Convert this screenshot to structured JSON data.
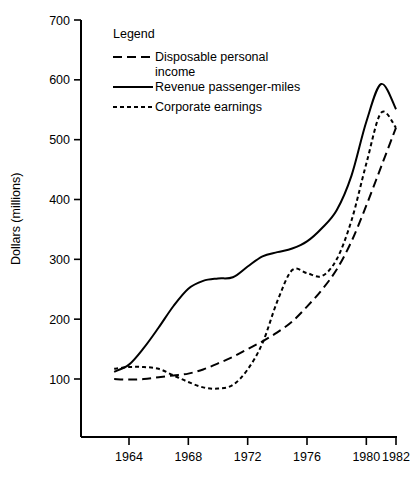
{
  "chart_data": {
    "type": "line",
    "title": "",
    "xlabel": "",
    "ylabel": "Dollars (millions)",
    "xlim": [
      1962.8,
      1982
    ],
    "ylim": [
      0,
      700
    ],
    "ytick_labels": [
      "100",
      "200",
      "300",
      "400",
      "500",
      "600",
      "700"
    ],
    "ytick_values": [
      100,
      200,
      300,
      400,
      500,
      600,
      700
    ],
    "xtick_labels": [
      "1964",
      "1968",
      "1972",
      "1976",
      "1980",
      "1982"
    ],
    "xtick_values": [
      1964,
      1968,
      1972,
      1976,
      1980,
      1982
    ],
    "grid": false,
    "legend_position": "upper-left-inside",
    "legend_title": "Legend",
    "series": [
      {
        "name": "Disposable personal income",
        "style": "long-dash",
        "x": [
          1963.0,
          1964.0,
          1965.0,
          1966.0,
          1967.0,
          1968.0,
          1969.0,
          1970.0,
          1971.0,
          1972.0,
          1973.0,
          1974.0,
          1975.0,
          1976.0,
          1977.0,
          1978.0,
          1979.0,
          1980.0,
          1981.0,
          1982.0
        ],
        "values": [
          100,
          99,
          100,
          103,
          106,
          109,
          116,
          126,
          137,
          150,
          163,
          178,
          196,
          221,
          249,
          283,
          330,
          390,
          455,
          520
        ]
      },
      {
        "name": "Revenue passenger-miles",
        "style": "solid",
        "x": [
          1963.0,
          1964.0,
          1965.0,
          1966.0,
          1967.0,
          1968.0,
          1969.0,
          1970.0,
          1971.0,
          1972.0,
          1973.0,
          1974.0,
          1975.0,
          1976.0,
          1977.0,
          1978.0,
          1979.0,
          1980.0,
          1981.0,
          1982.0
        ],
        "values": [
          112,
          124,
          152,
          186,
          222,
          251,
          264,
          268,
          270,
          288,
          305,
          312,
          318,
          330,
          352,
          382,
          440,
          530,
          593,
          551
        ]
      },
      {
        "name": "Corporate earnings",
        "style": "short-dash",
        "x": [
          1963.0,
          1964.0,
          1965.0,
          1966.0,
          1967.0,
          1968.0,
          1969.0,
          1970.0,
          1971.0,
          1972.0,
          1973.0,
          1974.0,
          1975.0,
          1976.0,
          1977.0,
          1978.0,
          1979.0,
          1980.0,
          1981.0,
          1982.0
        ],
        "values": [
          117,
          120,
          120,
          117,
          106,
          95,
          86,
          84,
          90,
          116,
          160,
          230,
          282,
          277,
          272,
          300,
          365,
          460,
          545,
          520
        ]
      }
    ],
    "annotations": []
  },
  "legend": {
    "title": "Legend",
    "items": [
      {
        "label_line1": "Disposable personal",
        "label_line2": "income",
        "style": "long-dash"
      },
      {
        "label_line1": "Revenue passenger-miles",
        "label_line2": "",
        "style": "solid"
      },
      {
        "label_line1": "Corporate earnings",
        "label_line2": "",
        "style": "short-dash"
      }
    ]
  },
  "axes": {
    "y_title": "Dollars (millions)",
    "y_labels": [
      "700",
      "600",
      "500",
      "400",
      "300",
      "200",
      "100"
    ],
    "x_labels": [
      "1964",
      "1968",
      "1972",
      "1976",
      "1980",
      "1982"
    ]
  },
  "colors": {
    "ink": "#000000",
    "background": "#ffffff"
  }
}
